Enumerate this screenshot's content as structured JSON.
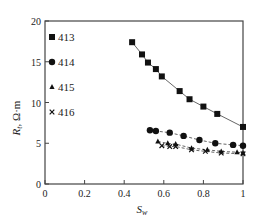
{
  "chart_data": {
    "type": "scatter",
    "title": "",
    "xlabel": "S_w",
    "ylabel": "R_t, Ω·m",
    "xlim": [
      0,
      1
    ],
    "ylim": [
      0,
      20
    ],
    "xticks": [
      0,
      0.2,
      0.4,
      0.6,
      0.8,
      1
    ],
    "xtick_labels": [
      "0",
      "0.2",
      "0.4",
      "0.6",
      "0.8",
      "1"
    ],
    "yticks": [
      0,
      5,
      10,
      15,
      20
    ],
    "ytick_labels": [
      "0",
      "5",
      "10",
      "15",
      "20"
    ],
    "grid": false,
    "legend_position": "inside upper left",
    "series": [
      {
        "name": "413",
        "marker": "square",
        "line": "solid",
        "x": [
          0.44,
          0.49,
          0.52,
          0.56,
          0.59,
          0.68,
          0.73,
          0.8,
          0.87,
          1.0
        ],
        "y": [
          17.4,
          15.9,
          14.9,
          14.1,
          13.2,
          11.4,
          10.4,
          9.5,
          8.6,
          7.0
        ]
      },
      {
        "name": "414",
        "marker": "circle",
        "line": "dashed",
        "x": [
          0.53,
          0.56,
          0.63,
          0.7,
          0.78,
          0.86,
          0.95,
          1.0
        ],
        "y": [
          6.6,
          6.5,
          6.3,
          5.9,
          5.4,
          5.0,
          4.8,
          4.7
        ]
      },
      {
        "name": "415",
        "marker": "triangle",
        "line": "dashed",
        "x": [
          0.57,
          0.62,
          0.66,
          0.74,
          0.82,
          0.89,
          0.97,
          1.0
        ],
        "y": [
          5.2,
          5.0,
          4.9,
          4.4,
          4.2,
          4.0,
          3.9,
          3.8
        ]
      },
      {
        "name": "416",
        "marker": "cross",
        "line": "dashed",
        "x": [
          0.59,
          0.63,
          0.66,
          0.74,
          0.81,
          0.89,
          1.0
        ],
        "y": [
          4.7,
          4.6,
          4.6,
          4.2,
          4.0,
          3.8,
          3.7
        ]
      }
    ]
  },
  "axes": {
    "xlabel_main": "S",
    "xlabel_sub": "w",
    "ylabel_main": "R",
    "ylabel_sub": "t",
    "ylabel_unit": ", Ω·m"
  },
  "legend": [
    {
      "label": "413"
    },
    {
      "label": "414"
    },
    {
      "label": "415"
    },
    {
      "label": "416"
    }
  ]
}
